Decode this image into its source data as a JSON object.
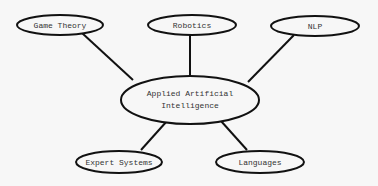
{
  "diagram": {
    "type": "mind-map",
    "center": {
      "id": "center",
      "label_line1": "Applied Artificial",
      "label_line2": "Intelligence",
      "cx": 190,
      "cy": 100,
      "rx": 69,
      "ry": 24
    },
    "nodes": [
      {
        "id": "game-theory",
        "label": "Game Theory",
        "cx": 60,
        "cy": 25,
        "rx": 43,
        "ry": 10,
        "edge_from": [
          82,
          33
        ],
        "edge_to": [
          133,
          80
        ]
      },
      {
        "id": "robotics",
        "label": "Robotics",
        "cx": 192,
        "cy": 25,
        "rx": 44,
        "ry": 10,
        "edge_from": [
          190,
          35
        ],
        "edge_to": [
          190,
          76
        ]
      },
      {
        "id": "nlp",
        "label": "NLP",
        "cx": 315,
        "cy": 26,
        "rx": 44,
        "ry": 10,
        "edge_from": [
          294,
          35
        ],
        "edge_to": [
          248,
          82
        ]
      },
      {
        "id": "expert-systems",
        "label": "Expert Systems",
        "cx": 119,
        "cy": 162,
        "rx": 43,
        "ry": 11,
        "edge_from": [
          141,
          150
        ],
        "edge_to": [
          167,
          121
        ]
      },
      {
        "id": "languages",
        "label": "Languages",
        "cx": 260,
        "cy": 162,
        "rx": 44,
        "ry": 11,
        "edge_from": [
          247,
          150
        ],
        "edge_to": [
          221,
          121
        ]
      }
    ],
    "colors": {
      "stroke": "#111111",
      "fill": "#f7f7f7",
      "text": "#333333"
    }
  }
}
